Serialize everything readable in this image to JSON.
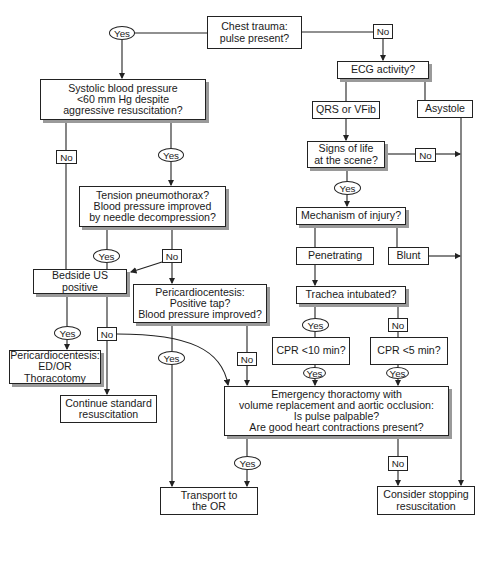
{
  "diagram": {
    "type": "flowchart",
    "topic": "Chest trauma resuscitation algorithm",
    "nodes": {
      "start": "Chest trauma:\npulse present?",
      "systolic": "Systolic blood pressure\n<60 mm Hg despite\naggressive resuscitation?",
      "ecg": "ECG activity?",
      "qrs": "QRS or VFib",
      "asystole": "Asystole",
      "signs": "Signs of life\nat the scene?",
      "tension": "Tension pneumothorax?\nBlood pressure improved\nby needle decompression?",
      "mechanism": "Mechanism of injury?",
      "penetrating": "Penetrating",
      "blunt": "Blunt",
      "bedside": "Bedside US\npositive",
      "pericardio_mid": "Pericardiocentesis:\nPositive tap?\nBlood pressure improved?",
      "trachea": "Trachea intubated?",
      "cpr10": "CPR <10 min?",
      "cpr5": "CPR <5 min?",
      "pericardio_left": "Pericardiocentesis:\nED/OR\nThoracotomy",
      "continue": "Continue standard\nresuscitation",
      "emergency": "Emergency thoractomy with\nvolume replacement and aortic occlusion:\nIs pulse palpable?\nAre good heart contractions present?",
      "transport": "Transport to\nthe OR",
      "consider": "Consider stopping\nresuscitation"
    },
    "labels": {
      "yes": "Yes",
      "no": "No"
    },
    "edges": [
      {
        "from": "start",
        "to": "systolic",
        "label": "Yes"
      },
      {
        "from": "start",
        "to": "ecg",
        "label": "No"
      },
      {
        "from": "systolic",
        "to": "bedside",
        "label": "No"
      },
      {
        "from": "systolic",
        "to": "tension",
        "label": "Yes"
      },
      {
        "from": "ecg",
        "to": "qrs",
        "label": ""
      },
      {
        "from": "ecg",
        "to": "asystole",
        "label": ""
      },
      {
        "from": "qrs",
        "to": "signs",
        "label": ""
      },
      {
        "from": "signs",
        "to": "consider",
        "label": "No"
      },
      {
        "from": "signs",
        "to": "mechanism",
        "label": "Yes"
      },
      {
        "from": "asystole",
        "to": "consider",
        "label": ""
      },
      {
        "from": "tension",
        "to": "bedside",
        "label": "Yes"
      },
      {
        "from": "tension",
        "to": "bedside",
        "label": "No"
      },
      {
        "from": "tension",
        "to": "pericardio_mid",
        "label": "No"
      },
      {
        "from": "mechanism",
        "to": "penetrating",
        "label": ""
      },
      {
        "from": "mechanism",
        "to": "blunt",
        "label": ""
      },
      {
        "from": "blunt",
        "to": "consider",
        "label": ""
      },
      {
        "from": "penetrating",
        "to": "trachea",
        "label": ""
      },
      {
        "from": "trachea",
        "to": "cpr10",
        "label": "Yes"
      },
      {
        "from": "trachea",
        "to": "cpr5",
        "label": "No"
      },
      {
        "from": "bedside",
        "to": "pericardio_left",
        "label": "Yes"
      },
      {
        "from": "bedside",
        "to": "continue",
        "label": "No"
      },
      {
        "from": "bedside",
        "to": "emergency",
        "label": "No"
      },
      {
        "from": "pericardio_mid",
        "to": "transport",
        "label": "Yes"
      },
      {
        "from": "pericardio_mid",
        "to": "emergency",
        "label": "No"
      },
      {
        "from": "cpr10",
        "to": "emergency",
        "label": "Yes"
      },
      {
        "from": "cpr5",
        "to": "emergency",
        "label": "Yes"
      },
      {
        "from": "emergency",
        "to": "transport",
        "label": "Yes"
      },
      {
        "from": "emergency",
        "to": "consider",
        "label": "No"
      }
    ]
  }
}
